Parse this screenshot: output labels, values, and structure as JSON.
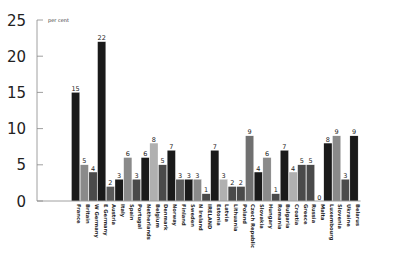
{
  "chart_data": {
    "type": "bar",
    "title": "",
    "ylabel": "per cent",
    "xlabel": "",
    "ylim": [
      0,
      25
    ],
    "yticks": [
      0,
      5,
      10,
      15,
      20,
      25
    ],
    "grid": false,
    "legend": null,
    "categories": [
      "France",
      "Britain",
      "W Germany",
      "E Germany",
      "Austria",
      "Italy",
      "Spain",
      "Portugal",
      "Netherlands",
      "Belgium",
      "Denmark",
      "Norway",
      "Finland",
      "Sweden",
      "N Ireland",
      "IRELAND",
      "Estonia",
      "Latvia",
      "Lithuania",
      "Poland",
      "Czech Republic",
      "Slovakia",
      "Hungary",
      "Romania",
      "Bulgaria",
      "Croatia",
      "Greece",
      "Russia",
      "Malta",
      "Luxembourg",
      "Slovenia",
      "Ukraine",
      "Belarus"
    ],
    "values": [
      15,
      5,
      4,
      22,
      2,
      3,
      6,
      3,
      6,
      8,
      5,
      7,
      3,
      3,
      3,
      1,
      7,
      3,
      2,
      2,
      9,
      4,
      6,
      1,
      7,
      4,
      5,
      5,
      0,
      8,
      9,
      3,
      9
    ],
    "colors": [
      "#1a1a1a",
      "#8a8a8a",
      "#4a4a4a",
      "#1a1a1a",
      "#5a5a5a",
      "#1a1a1a",
      "#8a8a8a",
      "#4a4a4a",
      "#1a1a1a",
      "#b0b0b0",
      "#4a4a4a",
      "#1a1a1a",
      "#5a5a5a",
      "#1a1a1a",
      "#8a8a8a",
      "#4a4a4a",
      "#1a1a1a",
      "#b0b0b0",
      "#4a4a4a",
      "#4a4a4a",
      "#707070",
      "#1a1a1a",
      "#8a8a8a",
      "#4a4a4a",
      "#1a1a1a",
      "#b0b0b0",
      "#4a4a4a",
      "#4a4a4a",
      "#1a1a1a",
      "#1a1a1a",
      "#8a8a8a",
      "#4a4a4a",
      "#1a1a1a"
    ]
  },
  "axis": {
    "unit_label": "per cent",
    "color": "#888888"
  }
}
